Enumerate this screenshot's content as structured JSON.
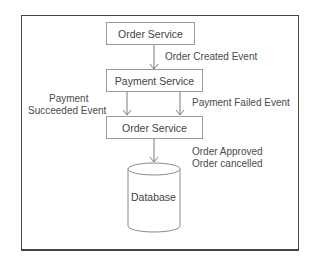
{
  "diagram": {
    "nodes": {
      "order_service_top": "Order Service",
      "payment_service": "Payment Service",
      "order_service_bottom": "Order Service",
      "database": "Database"
    },
    "edges": {
      "order_created": "Order Created Event",
      "payment_succeeded_line1": "Payment",
      "payment_succeeded_line2": "Succeeded Event",
      "payment_failed": "Payment Failed Event",
      "order_approved": "Order Approved",
      "order_cancelled": "Order cancelled"
    },
    "colors": {
      "frame": "#444444",
      "box_border": "#9a9a9a",
      "arrow": "#777777",
      "text": "#444444"
    }
  }
}
